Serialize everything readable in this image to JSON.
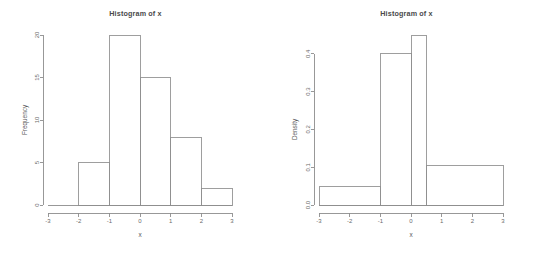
{
  "figure": {
    "background_color": "#ffffff",
    "line_color": "#8d8d8d",
    "text_color": "#5a5a5a",
    "panel_count": 2
  },
  "chart_data": [
    {
      "type": "bar",
      "panel": "left",
      "title": "Histogram of x",
      "xlabel": "x",
      "ylabel": "Frequency",
      "xlim": [
        -3,
        3
      ],
      "ylim": [
        0,
        20
      ],
      "xticks": [
        -3,
        -2,
        -1,
        0,
        1,
        2,
        3
      ],
      "xticklabels": [
        "-3",
        "-2",
        "-1",
        "0",
        "1",
        "2",
        "3"
      ],
      "yticks": [
        0,
        5,
        10,
        15,
        20
      ],
      "yticklabels": [
        "0",
        "5",
        "10",
        "15",
        "20"
      ],
      "grid": false,
      "legend": false,
      "bin_edges": [
        -3,
        -2,
        -1,
        0,
        1,
        2,
        3
      ],
      "values": [
        0,
        5,
        20,
        15,
        8,
        2
      ],
      "bins": [
        {
          "x0": -3,
          "x1": -2,
          "value": 0
        },
        {
          "x0": -2,
          "x1": -1,
          "value": 5
        },
        {
          "x0": -1,
          "x1": 0,
          "value": 20
        },
        {
          "x0": 0,
          "x1": 1,
          "value": 15
        },
        {
          "x0": 1,
          "x1": 2,
          "value": 8
        },
        {
          "x0": 2,
          "x1": 3,
          "value": 2
        }
      ]
    },
    {
      "type": "bar",
      "panel": "right",
      "title": "Histogram of x",
      "xlabel": "x",
      "ylabel": "Density",
      "xlim": [
        -3,
        3
      ],
      "ylim": [
        0,
        0.45
      ],
      "xticks": [
        -3,
        -2,
        -1,
        0,
        1,
        2,
        3
      ],
      "xticklabels": [
        "-3",
        "-2",
        "-1",
        "0",
        "1",
        "2",
        "3"
      ],
      "yticks": [
        0.0,
        0.1,
        0.2,
        0.3,
        0.4
      ],
      "yticklabels": [
        "0.0",
        "0.1",
        "0.2",
        "0.3",
        "0.4"
      ],
      "grid": false,
      "legend": false,
      "bin_edges": [
        -3,
        -1,
        0,
        0.5,
        3
      ],
      "values": [
        0.05,
        0.4,
        0.45,
        0.105
      ],
      "bins": [
        {
          "x0": -3,
          "x1": -1,
          "value": 0.05
        },
        {
          "x0": -1,
          "x1": 0,
          "value": 0.4
        },
        {
          "x0": 0,
          "x1": 0.5,
          "value": 0.45
        },
        {
          "x0": 0.5,
          "x1": 3,
          "value": 0.105
        }
      ]
    }
  ]
}
